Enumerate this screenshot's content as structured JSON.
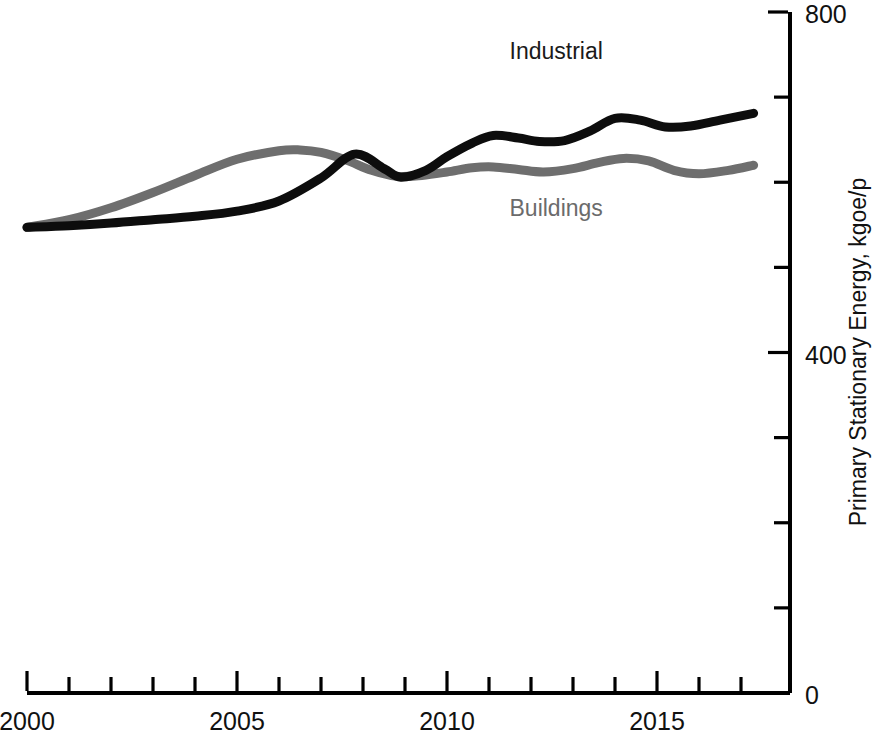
{
  "chart_data": {
    "type": "line",
    "title": "",
    "subtitle": "",
    "xlabel": "",
    "ylabel": "Primary Stationary Energy, kgoe/p",
    "xlim": [
      2000,
      2017.8
    ],
    "ylim": [
      0,
      800
    ],
    "grid": false,
    "legend_position": "inline-annotations",
    "x_ticks": [
      2000,
      2001,
      2002,
      2003,
      2004,
      2005,
      2006,
      2007,
      2008,
      2009,
      2010,
      2011,
      2012,
      2013,
      2014,
      2015,
      2016,
      2017
    ],
    "x_tick_labels": [
      "2000",
      "",
      "",
      "",
      "",
      "2005",
      "",
      "",
      "",
      "",
      "2010",
      "",
      "",
      "",
      "",
      "2015",
      "",
      ""
    ],
    "y_ticks": [
      0,
      100,
      200,
      300,
      400,
      500,
      600,
      700,
      800
    ],
    "y_tick_labels": [
      "0",
      "",
      "",
      "",
      "400",
      "",
      "",
      "",
      "800"
    ],
    "y_axis_side": "right",
    "series": [
      {
        "name": "Industrial",
        "color": "#0d0d0d",
        "stroke_width": 9,
        "label_x": 2012.6,
        "label_y": 745,
        "x": [
          2000,
          2001,
          2002,
          2003,
          2004,
          2005,
          2006,
          2007,
          2007.8,
          2008.5,
          2008.9,
          2009.5,
          2010,
          2010.6,
          2011.1,
          2011.7,
          2012.2,
          2012.8,
          2013.4,
          2014,
          2014.6,
          2015.2,
          2015.8,
          2016.5,
          2017.3
        ],
        "y": [
          547,
          549,
          552,
          556,
          560,
          566,
          578,
          605,
          633,
          616,
          606,
          614,
          630,
          646,
          655,
          652,
          648,
          649,
          660,
          675,
          673,
          665,
          666,
          673,
          681
        ]
      },
      {
        "name": "Buildings",
        "color": "#6e6e6e",
        "stroke_width": 9,
        "label_x": 2012.6,
        "label_y": 560,
        "x": [
          2000,
          2001,
          2002,
          2003,
          2004,
          2005,
          2006,
          2006.5,
          2007,
          2007.6,
          2008.2,
          2008.8,
          2009.4,
          2010,
          2010.6,
          2011.1,
          2011.7,
          2012.3,
          2013,
          2013.6,
          2014.2,
          2014.8,
          2015.4,
          2016,
          2016.7,
          2017.3
        ],
        "y": [
          547,
          556,
          570,
          588,
          608,
          627,
          637,
          638,
          635,
          626,
          614,
          607,
          608,
          612,
          617,
          618,
          615,
          612,
          616,
          623,
          628,
          625,
          614,
          610,
          614,
          620
        ]
      }
    ]
  },
  "axes": {
    "y_axis_title": "Primary Stationary Energy, kgoe/p",
    "y_labels": {
      "top": "800",
      "middle": "400",
      "bottom": "0"
    },
    "x_labels": {
      "first": "2000",
      "second": "2005",
      "third": "2010",
      "fourth": "2015"
    }
  },
  "annotations": {
    "industrial": "Industrial",
    "buildings": "Buildings"
  },
  "colors": {
    "industrial": "#0d0d0d",
    "buildings": "#6e6e6e",
    "axis": "#000000",
    "background": "#ffffff"
  }
}
